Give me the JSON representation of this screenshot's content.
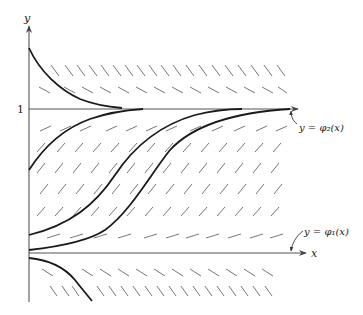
{
  "figure": {
    "type": "direction-field-diagram",
    "axes": {
      "x_label": "x",
      "y_label": "y",
      "y_tick_label": "1"
    },
    "annotations": {
      "phi2": "y = φ₂(x)",
      "phi1": "y = φ₁(x)"
    },
    "colors": {
      "ink": "#1a1a1a",
      "axis": "#555555",
      "slope_marks": "#666666",
      "background": "#ffffff"
    },
    "equilibria": [
      {
        "name": "phi1",
        "y": 0
      },
      {
        "name": "phi2",
        "y": 1
      }
    ],
    "solution_curves": [
      {
        "id": "above-1-decaying",
        "y0_approx": 1.7,
        "behavior": "decreases toward y=1"
      },
      {
        "id": "between-upper",
        "y0_approx": 0.55,
        "behavior": "increases toward y=1"
      },
      {
        "id": "between-middle",
        "y0_approx": 0.12,
        "behavior": "S-shaped increase toward y=1"
      },
      {
        "id": "between-lower",
        "y0_approx": 0.02,
        "behavior": "S-shaped increase toward y=1"
      },
      {
        "id": "below-0",
        "y0_approx": -0.05,
        "behavior": "decreases away from y=0"
      }
    ]
  }
}
